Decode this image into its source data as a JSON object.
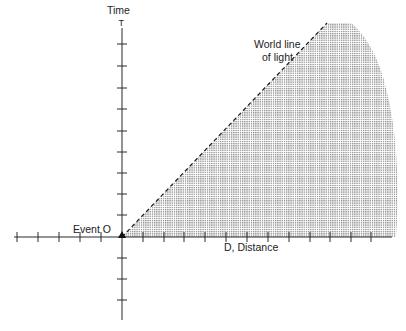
{
  "diagram": {
    "labels": {
      "time_axis": "Time",
      "time_axis_symbol": "T",
      "distance_axis": "D, Distance",
      "world_line_line1": "World line",
      "world_line_line2": "of light",
      "event": "Event O"
    },
    "colors": {
      "axis": "#2a2a2a",
      "shading": "#9a9a9a",
      "background": "#ffffff",
      "text": "#222222"
    },
    "origin": {
      "x": 122,
      "y": 237
    },
    "time_axis": {
      "top_y": 22,
      "bottom_y": 320,
      "tick_spacing": 21.5,
      "ticks_above": 9,
      "ticks_below": 3
    },
    "distance_axis": {
      "left_x": 14,
      "right_x": 392,
      "tick_spacing": 20.9,
      "ticks_left": 5,
      "ticks_right": 13
    },
    "shaded_region": "future light cone region between world line of light and time-like boundary arc",
    "world_line": {
      "style": "dashed",
      "from": [
        122,
        237
      ],
      "to": [
        327,
        23
      ]
    }
  }
}
